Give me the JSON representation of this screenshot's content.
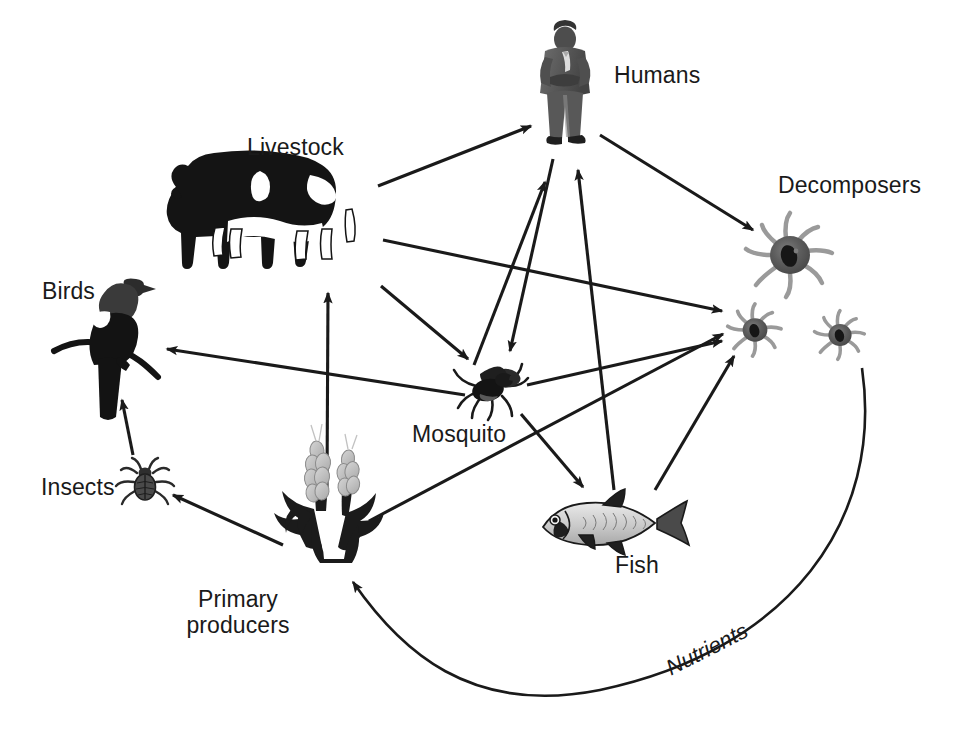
{
  "diagram": {
    "background_color": "#ffffff",
    "line_color": "#1a1a1a",
    "text_color": "#1a1a1a"
  },
  "nodes": [
    {
      "id": "humans",
      "label": "Humans",
      "icon": "businessman-figure-icon",
      "x": 565,
      "y": 85,
      "label_x": 614,
      "label_y": 62
    },
    {
      "id": "livestock",
      "label": "Livestock",
      "icon": "dairy-cow-icon",
      "x": 280,
      "y": 215,
      "label_x": 247,
      "label_y": 134
    },
    {
      "id": "birds",
      "label": "Birds",
      "icon": "perched-bird-icon",
      "x": 110,
      "y": 345,
      "label_x": 42,
      "label_y": 278
    },
    {
      "id": "insects",
      "label": "Insects",
      "icon": "beetle-icon",
      "x": 145,
      "y": 485,
      "label_x": 41,
      "label_y": 474
    },
    {
      "id": "primary_producers",
      "label": "Primary\nproducers",
      "icon": "wheat-grass-icon",
      "x": 320,
      "y": 545,
      "label_x": 163,
      "label_y": 586
    },
    {
      "id": "mosquito",
      "label": "Mosquito",
      "icon": "mosquito-icon",
      "x": 490,
      "y": 390,
      "label_x": 412,
      "label_y": 421
    },
    {
      "id": "fish",
      "label": "Fish",
      "icon": "fish-icon",
      "x": 605,
      "y": 525,
      "label_x": 615,
      "label_y": 552
    },
    {
      "id": "decomposers",
      "label": "Decomposers",
      "icon": "amoeba-microbe-icon",
      "x": 790,
      "y": 255,
      "label_x": 778,
      "label_y": 172
    }
  ],
  "flows": [
    {
      "label": "Nutrients",
      "from": "decomposers",
      "to": "primary_producers",
      "style": "curved",
      "rotation_deg": -27,
      "label_x": 662,
      "label_y": 658
    }
  ],
  "links": [
    {
      "from": "livestock",
      "to": "humans"
    },
    {
      "from": "livestock",
      "to": "decomposers"
    },
    {
      "from": "livestock",
      "to": "mosquito"
    },
    {
      "from": "primary_producers",
      "to": "livestock"
    },
    {
      "from": "primary_producers",
      "to": "insects"
    },
    {
      "from": "primary_producers",
      "to": "decomposers"
    },
    {
      "from": "insects",
      "to": "birds"
    },
    {
      "from": "mosquito",
      "to": "birds"
    },
    {
      "from": "mosquito",
      "to": "humans"
    },
    {
      "from": "mosquito",
      "to": "fish"
    },
    {
      "from": "mosquito",
      "to": "decomposers"
    },
    {
      "from": "humans",
      "to": "decomposers"
    },
    {
      "from": "fish",
      "to": "humans"
    },
    {
      "from": "fish",
      "to": "decomposers"
    },
    {
      "from": "decomposers",
      "to": "primary_producers"
    }
  ]
}
